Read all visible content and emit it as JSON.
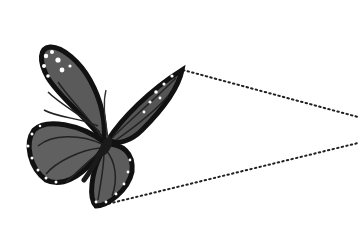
{
  "image": {
    "subject": "monarch butterfly illustration (grayscale)",
    "background": "#ffffff",
    "wing_fill": "#5a5a5a",
    "wing_border": "#111111",
    "spot_color": "#ffffff",
    "dotted_line_color": "#222222"
  },
  "dotted_lines": [
    {
      "from": [
        183,
        70
      ],
      "to": [
        358,
        117
      ]
    },
    {
      "from": [
        95,
        207
      ],
      "to": [
        358,
        143
      ]
    }
  ]
}
